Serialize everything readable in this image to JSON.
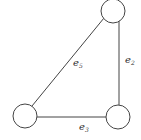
{
  "diagram": {
    "type": "graph",
    "nodes": [
      {
        "id": "top",
        "label": ""
      },
      {
        "id": "bottom-left",
        "label": ""
      },
      {
        "id": "bottom-right",
        "label": ""
      }
    ],
    "edges": [
      {
        "id": "e5",
        "from": "bottom-left",
        "to": "top",
        "label_base": "e",
        "label_sub": "5"
      },
      {
        "id": "e2",
        "from": "top",
        "to": "bottom-right",
        "label_base": "e",
        "label_sub": "2"
      },
      {
        "id": "e3",
        "from": "bottom-left",
        "to": "bottom-right",
        "label_base": "e",
        "label_sub": "3"
      }
    ],
    "colors": {
      "stroke": "#444444",
      "background": "#ffffff"
    }
  }
}
